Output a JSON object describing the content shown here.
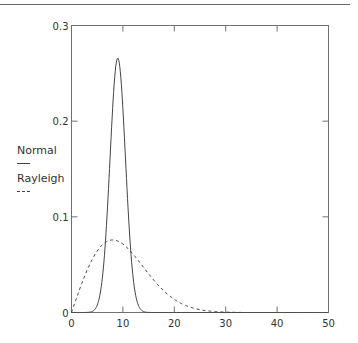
{
  "chart_data": {
    "type": "line",
    "title": "",
    "xlabel": "",
    "ylabel": "",
    "xlim": [
      0,
      50
    ],
    "ylim": [
      0,
      0.3
    ],
    "x_ticks": [
      0,
      10,
      20,
      30,
      40,
      50
    ],
    "x_tick_labels": [
      "0",
      "10",
      "20",
      "30",
      "40",
      "50"
    ],
    "y_ticks": [
      0,
      0.1,
      0.2,
      0.3
    ],
    "y_tick_labels": [
      "0",
      "0.1",
      "0.2",
      "0.3"
    ],
    "grid": false,
    "legend_position": "left, outside plot",
    "series": [
      {
        "name": "Normal",
        "style": "solid",
        "distribution": {
          "mean": 9,
          "sd": 1.5
        },
        "x": [
          0,
          4,
          5,
          6,
          7,
          8,
          8.5,
          9,
          9.5,
          10,
          11,
          12,
          13,
          14,
          15,
          50
        ],
        "y": [
          0,
          0.0011,
          0.0076,
          0.036,
          0.109,
          0.213,
          0.252,
          0.266,
          0.252,
          0.213,
          0.109,
          0.036,
          0.0076,
          0.0011,
          0.0001,
          0
        ]
      },
      {
        "name": "Rayleigh",
        "style": "dashed",
        "distribution": {
          "sigma": 8
        },
        "x": [
          0,
          2,
          4,
          6,
          8,
          10,
          12,
          14,
          16,
          18,
          20,
          22,
          24,
          26,
          28,
          30,
          33
        ],
        "y": [
          0,
          0.0303,
          0.0551,
          0.0709,
          0.0758,
          0.0717,
          0.0608,
          0.0474,
          0.0338,
          0.0224,
          0.0138,
          0.008,
          0.0042,
          0.0021,
          0.001,
          0.0004,
          0.0001
        ]
      }
    ]
  },
  "legend": {
    "items": [
      {
        "label": "Normal",
        "style": "solid"
      },
      {
        "label": "Rayleigh",
        "style": "dashed"
      }
    ]
  },
  "colors": {
    "axis": "#707070",
    "line": "#444444"
  }
}
